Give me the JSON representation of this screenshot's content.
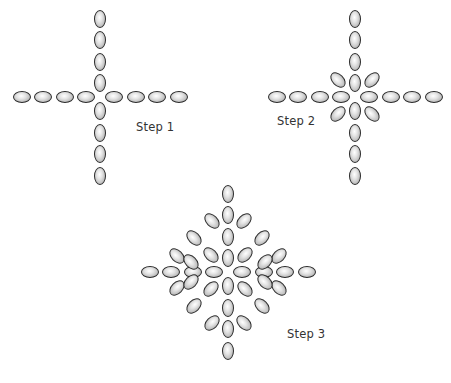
{
  "diagram": {
    "steps": [
      {
        "label": "Step 1",
        "center": [
          100,
          97
        ],
        "label_pos": [
          136,
          126
        ]
      },
      {
        "label": "Step 2",
        "center": [
          355,
          97
        ],
        "label_pos": [
          277,
          114
        ]
      },
      {
        "label": "Step 3",
        "center": [
          228,
          283
        ],
        "label_pos": [
          287,
          333
        ]
      }
    ],
    "bead": {
      "long": 18,
      "short": 12,
      "fill": "#c8c8c8",
      "outline": "#2a2a2a"
    }
  }
}
